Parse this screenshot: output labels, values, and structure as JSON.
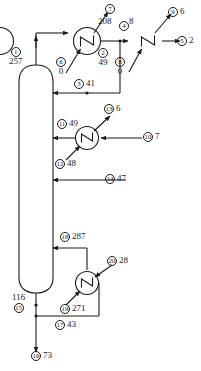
{
  "diagram": {
    "type": "process-flow-diagram",
    "colors": {
      "line": "#1a1a1a",
      "background": "#ffffff",
      "text": "#1a1a1a"
    },
    "equipment": [
      {
        "id": "column",
        "name": "distillation-column",
        "shape": "vertical-vessel"
      },
      {
        "id": "hx1",
        "name": "condenser-1",
        "shape": "heat-exchanger-circle"
      },
      {
        "id": "hx2",
        "name": "condenser-2",
        "shape": "heat-exchanger-circle"
      },
      {
        "id": "hx3",
        "name": "side-heat-exchanger",
        "shape": "heat-exchanger-circle"
      },
      {
        "id": "hx4",
        "name": "reboiler",
        "shape": "heat-exchanger-circle"
      }
    ],
    "streams": [
      {
        "tag": "1",
        "value": "257",
        "layout": "stack"
      },
      {
        "tag": "2",
        "value": "49",
        "layout": "stack"
      },
      {
        "tag": "3",
        "value": "41",
        "layout": "row"
      },
      {
        "tag": "4",
        "value": "8",
        "layout": "sup"
      },
      {
        "tag": "5",
        "value": "2",
        "layout": "row"
      },
      {
        "tag": "6",
        "value": "0",
        "layout": "stack"
      },
      {
        "tag": "7",
        "value": "208",
        "layout": "tag-above-value"
      },
      {
        "tag": "8",
        "value": "0",
        "layout": "stack"
      },
      {
        "tag": "9",
        "value": "6",
        "layout": "row"
      },
      {
        "tag": "10",
        "value": "7",
        "layout": "row"
      },
      {
        "tag": "11",
        "value": "49",
        "layout": "row"
      },
      {
        "tag": "12",
        "value": "48",
        "layout": "row"
      },
      {
        "tag": "13",
        "value": "6",
        "layout": "row"
      },
      {
        "tag": "14",
        "value": "47",
        "layout": "row"
      },
      {
        "tag": "15",
        "value": "116",
        "layout": "value-above-tag"
      },
      {
        "tag": "16",
        "value": "73",
        "layout": "row"
      },
      {
        "tag": "17",
        "value": "43",
        "layout": "row"
      },
      {
        "tag": "18",
        "value": "287",
        "layout": "row"
      },
      {
        "tag": "19",
        "value": "271",
        "layout": "row"
      },
      {
        "tag": "20",
        "value": "28",
        "layout": "row"
      }
    ],
    "labels": {
      "s1_tag": "1",
      "s1_val": "257",
      "s2_tag": "2",
      "s2_val": "49",
      "s3_tag": "3",
      "s3_val": "41",
      "s4_tag": "4",
      "s4_val": "8",
      "s5_tag": "5",
      "s5_val": "2",
      "s6_tag": "6",
      "s6_val": "0",
      "s7_tag": "7",
      "s7_val": "208",
      "s8_tag": "8",
      "s8_val": "0",
      "s9_tag": "9",
      "s9_val": "6",
      "s10_tag": "10",
      "s10_val": "7",
      "s11_tag": "11",
      "s11_val": "49",
      "s12_tag": "12",
      "s12_val": "48",
      "s13_tag": "13",
      "s13_val": "6",
      "s14_tag": "14",
      "s14_val": "47",
      "s15_tag": "15",
      "s15_val": "116",
      "s16_tag": "16",
      "s16_val": "73",
      "s17_tag": "17",
      "s17_val": "43",
      "s18_tag": "18",
      "s18_val": "287",
      "s19_tag": "19",
      "s19_val": "271",
      "s20_tag": "20",
      "s20_val": "28"
    }
  }
}
